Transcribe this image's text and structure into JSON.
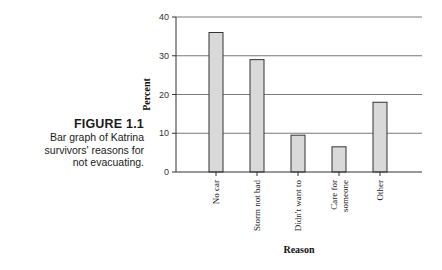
{
  "caption": {
    "figure_label": "FIGURE 1.1",
    "description_lines": [
      "Bar graph of Katrina",
      "survivors' reasons for",
      "not evacuating."
    ]
  },
  "colors": {
    "bar_fill": "#d9d9d9",
    "bar_stroke": "#333333",
    "grid": "#7a7a7a",
    "axis": "#333333"
  },
  "chart_data": {
    "type": "bar",
    "title": "",
    "xlabel": "Reason",
    "ylabel": "Percent",
    "categories": [
      [
        "No car"
      ],
      [
        "Storm not bad"
      ],
      [
        "Didn't want to"
      ],
      [
        "Care for",
        "someone"
      ],
      [
        "Other"
      ]
    ],
    "values": [
      36,
      29,
      9.5,
      6.5,
      18
    ],
    "ylim": [
      0,
      40
    ],
    "yticks": [
      0,
      10,
      20,
      30,
      40
    ],
    "grid": true,
    "legend": "none"
  }
}
